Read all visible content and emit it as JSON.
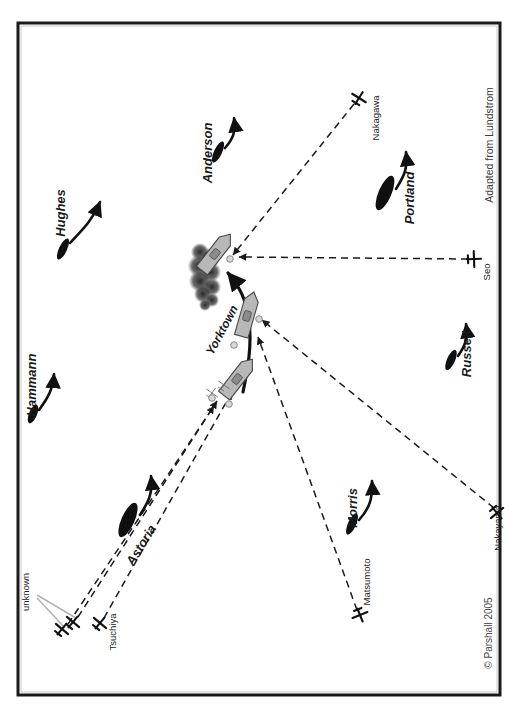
{
  "figure": {
    "attribution_note": "Adapted from Lundstrom",
    "copyright": "© Parshall 2005",
    "border_color": "#1a1a1a",
    "background": "#ffffff",
    "ship_color": "#101010",
    "carrier_color": "#b8b8b8",
    "carrier_outline": "#4a4a4a",
    "track_color": "#111111",
    "attack_path_color": "#1a1a1a",
    "smoke_color": "#3a3a3a",
    "leader_color": "#b5b5b5"
  },
  "us_ships": [
    {
      "name": "Hughes",
      "type": "destroyer",
      "label_x": 60,
      "label_y": 213,
      "label_rot": -90,
      "hull_x": 63,
      "hull_y": 249,
      "hull_w": 8,
      "hull_h": 23,
      "hull_rot": 25,
      "arrow": "M 70 243 C 80 232 92 222 100 202"
    },
    {
      "name": "Anderson",
      "type": "destroyer",
      "label_x": 207,
      "label_y": 153,
      "label_rot": -90,
      "hull_x": 218,
      "hull_y": 152,
      "hull_w": 8,
      "hull_h": 23,
      "hull_rot": 25,
      "arrow": "M 225 148 C 233 139 236 132 234 118"
    },
    {
      "name": "Hammann",
      "type": "destroyer",
      "label_x": 31,
      "label_y": 385,
      "label_rot": -90,
      "hull_x": 33,
      "hull_y": 414,
      "hull_w": 8,
      "hull_h": 20,
      "hull_rot": 22,
      "arrow": "M 39 410 C 47 399 53 390 54 374"
    },
    {
      "name": "Astoria",
      "type": "cruiser",
      "label_x": 141,
      "label_y": 545,
      "label_rot": -58,
      "hull_x": 128,
      "hull_y": 520,
      "hull_w": 13,
      "hull_h": 37,
      "hull_rot": 24,
      "arrow": "M 140 515 C 149 501 153 493 151 476"
    },
    {
      "name": "Portland",
      "type": "cruiser",
      "label_x": 409,
      "label_y": 198,
      "label_rot": -90,
      "hull_x": 385,
      "hull_y": 193,
      "hull_w": 13,
      "hull_h": 37,
      "hull_rot": 23,
      "arrow": "M 396 189 C 404 176 408 169 406 152"
    },
    {
      "name": "Russell",
      "type": "destroyer",
      "label_x": 466,
      "label_y": 354,
      "label_rot": -90,
      "hull_x": 451,
      "hull_y": 360,
      "hull_w": 8,
      "hull_h": 22,
      "hull_rot": 24,
      "arrow": "M 458 356 C 465 346 468 339 466 324"
    },
    {
      "name": "Morris",
      "type": "destroyer",
      "label_x": 352,
      "label_y": 508,
      "label_rot": -90,
      "hull_x": 352,
      "hull_y": 524,
      "hull_w": 8,
      "hull_h": 23,
      "hull_rot": 24,
      "arrow": "M 359 520 C 369 509 373 499 372 481"
    }
  ],
  "carrier": {
    "name": "Yorktown",
    "label_x": 222,
    "label_y": 330,
    "label_rot": -62,
    "positions": [
      {
        "x": 237,
        "y": 379,
        "w": 14,
        "h": 42,
        "rot": 38
      },
      {
        "x": 247,
        "y": 316,
        "w": 14,
        "h": 42,
        "rot": 16
      },
      {
        "x": 215,
        "y": 254,
        "w": 14,
        "h": 42,
        "rot": 38
      }
    ],
    "track": "M 243 392 C 248 368 252 345 249 322 C 247 300 239 286 228 273"
  },
  "japanese_aircraft": [
    {
      "name": "Nakagawa",
      "icon_x": 359,
      "icon_y": 98,
      "icon_rot": 32,
      "label_x": 375,
      "label_y": 118,
      "label_rot": -90,
      "path": "M 354 104 L 233 255"
    },
    {
      "name": "Seo",
      "icon_x": 474,
      "icon_y": 259,
      "icon_rot": 88,
      "label_x": 486,
      "label_y": 272,
      "label_rot": -90,
      "path": "M 468 259 L 239 257"
    },
    {
      "name": "Nakayama",
      "icon_x": 497,
      "icon_y": 513,
      "icon_rot": 140,
      "label_x": 497,
      "label_y": 528,
      "label_rot": -90,
      "path": "M 494 508 L 262 320"
    },
    {
      "name": "Matsumoto",
      "icon_x": 360,
      "icon_y": 615,
      "icon_rot": 158,
      "label_x": 366,
      "label_y": 582,
      "label_rot": -90,
      "path": "M 357 610 L 258 337"
    },
    {
      "name": "Tsuchiya",
      "icon_x": 100,
      "icon_y": 623,
      "icon_rot": 40,
      "label_x": 112,
      "label_y": 632,
      "label_rot": -90,
      "path": "M 104 618 L 232 392"
    },
    {
      "name": "unknown",
      "icon_x": 73,
      "icon_y": 622,
      "icon_rot": 40,
      "label_x": 25,
      "label_y": 592,
      "label_rot": -90,
      "path": "M 78 617 L 217 401"
    },
    {
      "name": "unknown",
      "icon_x": 62,
      "icon_y": 629,
      "icon_rot": 40,
      "label_x": null,
      "label_y": null,
      "label_rot": -90,
      "path": "M 68 624 L 214 406"
    }
  ],
  "unknown_leader_lines": [
    "M 37 595 L 76 618",
    "M 37 598 L 65 628"
  ],
  "bomb_hit_markers": [
    {
      "x": 230,
      "y": 259
    },
    {
      "x": 259,
      "y": 319
    },
    {
      "x": 234,
      "y": 345
    },
    {
      "x": 229,
      "y": 404
    },
    {
      "x": 212,
      "y": 398
    }
  ],
  "small_plane_symbols": [
    {
      "x": 212,
      "y": 393,
      "rot": 35
    },
    {
      "x": 224,
      "y": 385,
      "rot": 35
    }
  ],
  "smoke": {
    "cx": 207,
    "cy": 277,
    "blobs": [
      {
        "x": 200,
        "y": 252,
        "r": 9
      },
      {
        "x": 210,
        "y": 258,
        "r": 10
      },
      {
        "x": 199,
        "y": 266,
        "r": 11
      },
      {
        "x": 211,
        "y": 272,
        "r": 10
      },
      {
        "x": 200,
        "y": 281,
        "r": 11
      },
      {
        "x": 212,
        "y": 287,
        "r": 9
      },
      {
        "x": 203,
        "y": 294,
        "r": 9
      },
      {
        "x": 212,
        "y": 300,
        "r": 7
      },
      {
        "x": 205,
        "y": 305,
        "r": 6
      }
    ]
  }
}
